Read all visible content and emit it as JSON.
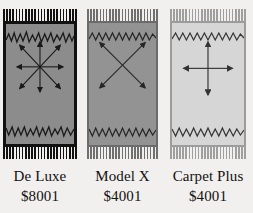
{
  "page": {
    "background_color": "#f2f0ee"
  },
  "products": [
    {
      "name": "De Luxe",
      "price": "$8001",
      "pattern": "eight-direction-radial-arrows",
      "arrow_count": 8,
      "field_color": "#8c8c8c",
      "border_color": "#111111",
      "fringe_color": "#111111",
      "accent_color": "#1a1a1a",
      "left": 3,
      "width": 74
    },
    {
      "name": "Model X",
      "price": "$4001",
      "pattern": "four-diagonal-arrows",
      "arrow_count": 4,
      "field_color": "#939393",
      "border_color": "#6b6b6b",
      "fringe_color": "#6f6f6f",
      "accent_color": "#262626",
      "left": 87,
      "width": 71
    },
    {
      "name": "Carpet Plus",
      "price": "$4001",
      "pattern": "four-cardinal-arrows",
      "arrow_count": 4,
      "field_color": "#d6d6d6",
      "border_color": "#9b9b9b",
      "fringe_color": "#9f9f9f",
      "accent_color": "#333333",
      "left": 170,
      "width": 76
    }
  ]
}
